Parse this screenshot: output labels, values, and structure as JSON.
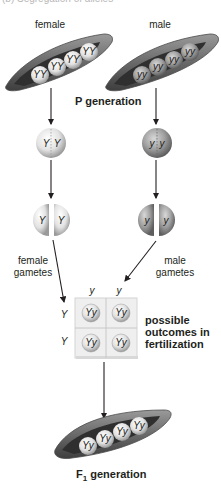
{
  "figure": {
    "clipped_caption": "(b) Segregation of alleles",
    "labels": {
      "female": "female",
      "male": "male",
      "p_generation": "P generation",
      "female_gametes": [
        "female",
        "gametes"
      ],
      "male_gametes": [
        "male",
        "gametes"
      ],
      "possible_outcomes": [
        "possible",
        "outcomes in",
        "fertilization"
      ],
      "f1_generation_prefix": "F",
      "f1_generation_sub": "1",
      "f1_generation_suffix": " generation"
    },
    "female_pod": {
      "seeds": [
        "YY",
        "YY",
        "YY",
        "YY"
      ]
    },
    "male_pod": {
      "seeds": [
        "yy",
        "yy",
        "yy",
        "yy"
      ]
    },
    "female_zygote": {
      "alleles": [
        "Y",
        "Y"
      ]
    },
    "male_zygote": {
      "alleles": [
        "y",
        "y"
      ]
    },
    "female_gametes": [
      "Y",
      "Y"
    ],
    "male_gametes": [
      "y",
      "y"
    ],
    "punnett": {
      "col_headers": [
        "y",
        "y"
      ],
      "row_headers": [
        "Y",
        "Y"
      ],
      "cells": [
        [
          "Yy",
          "Yy"
        ],
        [
          "Yy",
          "Yy"
        ]
      ]
    },
    "f1_pod": {
      "seeds": [
        "Yy",
        "Yy",
        "Yy",
        "Yy"
      ]
    },
    "colors": {
      "pod_outer": "#6e6e6e",
      "pod_inner": "#2f2f2f",
      "seed_light": "#e6e6e6",
      "seed_dark": "#8d8d8d",
      "arrow": "#231f20",
      "punnett_bg": "#efefef"
    }
  }
}
